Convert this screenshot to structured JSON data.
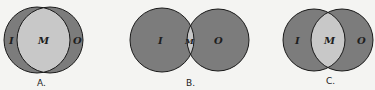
{
  "colors": {
    "background": "#f4f4f2",
    "outer_fill": "#7c7c7c",
    "overlap_fill": "#c8c8c8",
    "stroke": "#1a1a1a"
  },
  "diagrams": [
    {
      "caption": "A.",
      "left_label": "I",
      "middle_label": "M",
      "right_label": "O",
      "description": "Large overlap: M region dominates"
    },
    {
      "caption": "B.",
      "left_label": "I",
      "middle_label": "M",
      "right_label": "O",
      "description": "Small overlap: M region is a thin sliver"
    },
    {
      "caption": "C.",
      "left_label": "I",
      "middle_label": "M",
      "right_label": "O",
      "description": "Moderate overlap: M region medium-sized"
    }
  ]
}
